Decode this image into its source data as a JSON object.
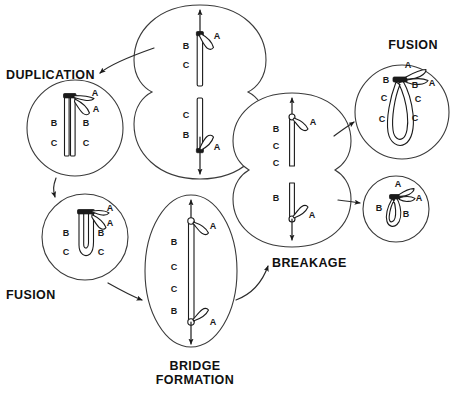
{
  "diagram": {
    "background_color": "#ffffff",
    "ink_color": "#1a1a1a",
    "cell_outline_color": "#3a3a3a",
    "stage_labels": [
      {
        "id": "duplication",
        "text": "DUPLICATION",
        "x": 6,
        "y": 79
      },
      {
        "id": "fusion-left",
        "text": "FUSION",
        "x": 6,
        "y": 299
      },
      {
        "id": "fusion-top-right",
        "text": "FUSION",
        "x": 413,
        "y": 49
      },
      {
        "id": "breakage",
        "text": "BREAKAGE",
        "x": 272,
        "y": 267
      },
      {
        "id": "bridge-formation-line1",
        "text": "BRIDGE",
        "x": 195,
        "y": 370
      },
      {
        "id": "bridge-formation-line2",
        "text": "FORMATION",
        "x": 195,
        "y": 384
      }
    ],
    "cells": [
      {
        "id": "anaphase-pair-top",
        "name": "anaphase-cell-pair-upper",
        "shape": "binucleate",
        "center_x": 200,
        "center_y": 95,
        "labels_upper": [
          "A",
          "B",
          "C"
        ],
        "labels_lower": [
          "C",
          "B",
          "A"
        ],
        "poles": [
          "up",
          "down"
        ]
      },
      {
        "id": "duplication-cell",
        "name": "duplication-cell",
        "shape": "circle",
        "center_x": 75,
        "center_y": 128,
        "radius": 48,
        "labels": [
          "A",
          "A",
          "B",
          "B",
          "C",
          "C"
        ],
        "structure": "sister-chromatids"
      },
      {
        "id": "fusion-cell-left",
        "name": "fusion-cell-lower-left",
        "shape": "circle",
        "center_x": 85,
        "center_y": 237,
        "radius": 43,
        "labels": [
          "A",
          "A",
          "B",
          "B",
          "C",
          "C"
        ],
        "structure": "dicentric-loop"
      },
      {
        "id": "bridge-cell",
        "name": "bridge-formation-cell",
        "shape": "ellipse",
        "center_x": 191,
        "center_y": 271,
        "rx": 46,
        "ry": 76,
        "labels": [
          "A",
          "B",
          "C",
          "C",
          "B",
          "A"
        ],
        "structure": "anaphase-bridge",
        "poles": [
          "up",
          "down"
        ]
      },
      {
        "id": "breakage-pair",
        "name": "breakage-cell-pair",
        "shape": "binucleate",
        "center_x": 292,
        "center_y": 155,
        "labels_upper": [
          "A",
          "B",
          "C",
          "C"
        ],
        "labels_lower": [
          "B",
          "A"
        ],
        "poles": [
          "up",
          "down"
        ]
      },
      {
        "id": "fusion-cell-top-right",
        "name": "fusion-cell-upper-right",
        "shape": "circle",
        "center_x": 402,
        "center_y": 112,
        "radius": 47,
        "labels": [
          "A",
          "A",
          "B",
          "B",
          "C",
          "C",
          "C",
          "C"
        ],
        "structure": "dicentric-loop-large"
      },
      {
        "id": "fusion-cell-small-right",
        "name": "fusion-cell-lower-right",
        "shape": "circle",
        "center_x": 396,
        "center_y": 209,
        "radius": 33,
        "labels": [
          "A",
          "A",
          "B",
          "B"
        ],
        "structure": "dicentric-loop-small"
      }
    ],
    "flow_arrows": [
      {
        "id": "arrow-anaphase-to-duplication",
        "from": "anaphase-pair-top",
        "to": "duplication-cell",
        "direction": "down-left"
      },
      {
        "id": "arrow-duplication-to-fusion",
        "from": "duplication-cell",
        "to": "fusion-cell-left",
        "direction": "down"
      },
      {
        "id": "arrow-fusion-to-bridge",
        "from": "fusion-cell-left",
        "to": "bridge-cell",
        "direction": "down-right"
      },
      {
        "id": "arrow-bridge-to-breakage",
        "from": "bridge-cell",
        "to": "breakage-pair",
        "direction": "up-right"
      },
      {
        "id": "arrow-breakage-to-fusion-top",
        "from": "breakage-pair",
        "to": "fusion-cell-top-right",
        "direction": "up-right"
      },
      {
        "id": "arrow-breakage-to-fusion-small",
        "from": "breakage-pair",
        "to": "fusion-cell-small-right",
        "direction": "right"
      }
    ]
  }
}
